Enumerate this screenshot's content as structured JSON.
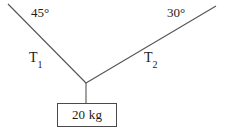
{
  "diagram": {
    "background_color": "#ffffff",
    "line_color": "#555555",
    "text_color": "#1a1a1a",
    "angles": {
      "left": "45°",
      "right": "30°"
    },
    "tensions": {
      "left": {
        "symbol": "T",
        "subscript": "1"
      },
      "right": {
        "symbol": "T",
        "subscript": "2"
      }
    },
    "mass": {
      "label": "20 kg",
      "value": "20",
      "unit": "kg"
    },
    "geometry": {
      "junction": {
        "x": 86,
        "y": 83
      },
      "left_rope_anchor": {
        "x": 8,
        "y": 4
      },
      "right_rope_anchor": {
        "x": 216,
        "y": 6
      },
      "hanger_bottom": {
        "x": 86,
        "y": 103
      },
      "box": {
        "x": 57,
        "y": 103,
        "width": 60,
        "height": 24
      }
    }
  }
}
